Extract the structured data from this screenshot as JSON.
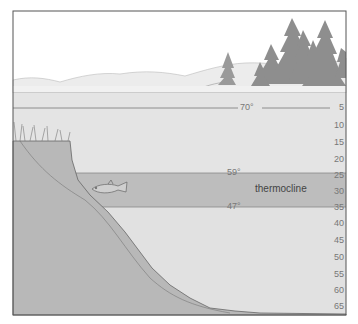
{
  "diagram": {
    "zone_label": "thermocline",
    "temperatures": [
      {
        "label": "70°",
        "depth": 5
      },
      {
        "label": "59°",
        "depth": 25
      },
      {
        "label": "47°",
        "depth": 35
      }
    ],
    "depth_scale": [
      "5",
      "10",
      "15",
      "20",
      "25",
      "30",
      "35",
      "40",
      "45",
      "50",
      "55",
      "60",
      "65"
    ],
    "elements": [
      "shoreline-hills",
      "pine-trees",
      "grassy-bank",
      "fish",
      "lake-bottom-slope"
    ],
    "colors": {
      "sky": "#ffffff",
      "hills": "#ececec",
      "water_upper": "#e4e4e4",
      "thermocline": "#bdbdbd",
      "water_lower": "#e1e1e1",
      "bottom": "#b8b8b8",
      "trees": "#8e8e8e",
      "frame": "#555555"
    }
  }
}
